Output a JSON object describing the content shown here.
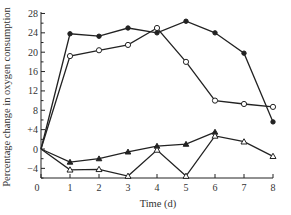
{
  "chart_data": {
    "type": "line",
    "title": "",
    "xlabel": "Time (d)",
    "ylabel": "Percentage change in oxygen consumption",
    "xlim": [
      0,
      8
    ],
    "ylim": [
      -6,
      28
    ],
    "x_ticks": [
      0,
      1,
      2,
      3,
      4,
      5,
      6,
      7,
      8
    ],
    "x_tick_labels": [
      "0",
      "1",
      "2",
      "3",
      "4",
      "5",
      "6",
      "7",
      "8"
    ],
    "y_ticks": [
      -4,
      0,
      4,
      8,
      12,
      16,
      20,
      24,
      28
    ],
    "y_tick_labels": [
      "−4",
      "0",
      "+4",
      "8",
      "12",
      "16",
      "20",
      "24",
      "28"
    ],
    "grid": false,
    "legend": null,
    "series": [
      {
        "name": "filled circles",
        "marker": "filled-circle",
        "x": [
          0,
          1,
          2,
          3,
          4,
          5,
          6,
          7,
          8
        ],
        "values": [
          0,
          23.8,
          23.3,
          25.0,
          24.0,
          26.4,
          24.0,
          19.8,
          5.6
        ]
      },
      {
        "name": "open circles",
        "marker": "open-circle",
        "x": [
          0,
          1,
          2,
          3,
          4,
          5,
          6,
          7,
          8
        ],
        "values": [
          0,
          19.2,
          20.4,
          21.5,
          25.0,
          18.0,
          10.0,
          9.3,
          8.7
        ]
      },
      {
        "name": "filled triangles",
        "marker": "filled-triangle",
        "x": [
          0,
          1,
          2,
          3,
          4,
          5,
          6
        ],
        "values": [
          0,
          -2.7,
          -2.0,
          -0.6,
          0.6,
          1.0,
          3.5
        ]
      },
      {
        "name": "open triangles",
        "marker": "open-triangle",
        "x": [
          0,
          1,
          2,
          3,
          4,
          5,
          6,
          7,
          8
        ],
        "values": [
          0,
          -4.3,
          -4.2,
          -5.6,
          -0.2,
          -5.6,
          2.7,
          1.5,
          -1.5
        ]
      }
    ]
  }
}
